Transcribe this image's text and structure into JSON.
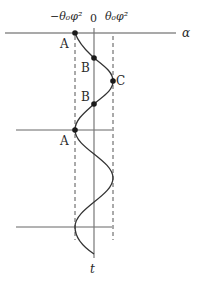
{
  "diagram": {
    "axis_label_alpha": "α",
    "axis_label_t": "t",
    "top_labels": {
      "left": "−θ₀φ²",
      "center": "0",
      "right": "θ₀φ²"
    },
    "points": [
      {
        "label": "A",
        "x": 75,
        "y": 33
      },
      {
        "label": "B",
        "x": 94,
        "y": 58
      },
      {
        "label": "C",
        "x": 113,
        "y": 81
      },
      {
        "label": "B",
        "x": 94,
        "y": 104
      },
      {
        "label": "A",
        "x": 75,
        "y": 130
      }
    ],
    "colors": {
      "line": "#3a3a3a",
      "axis": "#6a6a6a",
      "dashed": "#555555",
      "background": "#ffffff"
    }
  }
}
